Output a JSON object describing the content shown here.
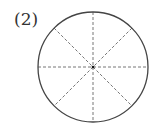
{
  "problem": {
    "label": "(2)"
  },
  "figure": {
    "type": "circle divided into 8 equal sectors by dashed lines",
    "sectors": 8,
    "outline_color": "#444444",
    "dash_color": "#666666",
    "center_dot_color": "#111111"
  }
}
